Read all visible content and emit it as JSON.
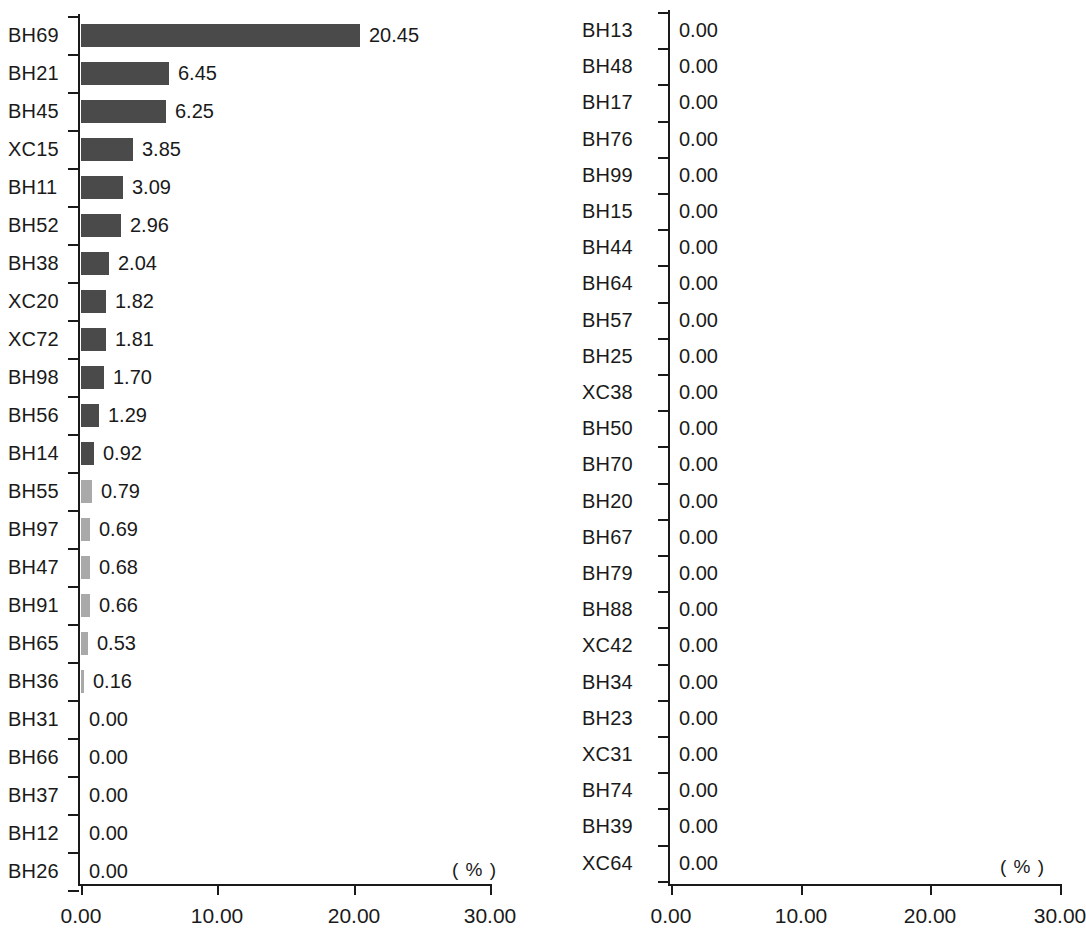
{
  "figure": {
    "background": "#ffffff",
    "bar_color": "#4a4a4a",
    "tiny_bar_color": "#a9a9a9",
    "axis_color": "#1a1a1a"
  },
  "chart_data": [
    {
      "type": "bar",
      "orientation": "horizontal",
      "id": "left-chart",
      "title": "",
      "xlabel": "( % )",
      "ylabel": "",
      "xlim": [
        0,
        30
      ],
      "grid": false,
      "legend": null,
      "xticks": [
        "0.00",
        "10.00",
        "20.00",
        "30.00"
      ],
      "xtick_values": [
        0,
        10,
        20,
        30
      ],
      "categories": [
        "BH69",
        "BH21",
        "BH45",
        "XC15",
        "BH11",
        "BH52",
        "BH38",
        "XC20",
        "XC72",
        "BH98",
        "BH56",
        "BH14",
        "BH55",
        "BH97",
        "BH47",
        "BH91",
        "BH65",
        "BH36",
        "BH31",
        "BH66",
        "BH37",
        "BH12",
        "BH26"
      ],
      "values": [
        20.45,
        6.45,
        6.25,
        3.85,
        3.09,
        2.96,
        2.04,
        1.82,
        1.81,
        1.7,
        1.29,
        0.92,
        0.79,
        0.69,
        0.68,
        0.66,
        0.53,
        0.16,
        0.0,
        0.0,
        0.0,
        0.0,
        0.0
      ],
      "value_labels": [
        "20.45",
        "6.45",
        "6.25",
        "3.85",
        "3.09",
        "2.96",
        "2.04",
        "1.82",
        "1.81",
        "1.70",
        "1.29",
        "0.92",
        "0.79",
        "0.69",
        "0.68",
        "0.66",
        "0.53",
        "0.16",
        "0.00",
        "0.00",
        "0.00",
        "0.00",
        "0.00"
      ]
    },
    {
      "type": "bar",
      "orientation": "horizontal",
      "id": "right-chart",
      "title": "",
      "xlabel": "( % )",
      "ylabel": "",
      "xlim": [
        0,
        30
      ],
      "grid": false,
      "legend": null,
      "xticks": [
        "0.00",
        "10.00",
        "20.00",
        "30.00"
      ],
      "xtick_values": [
        0,
        10,
        20,
        30
      ],
      "categories": [
        "BH13",
        "BH48",
        "BH17",
        "BH76",
        "BH99",
        "BH15",
        "BH44",
        "BH64",
        "BH57",
        "BH25",
        "XC38",
        "BH50",
        "BH70",
        "BH20",
        "BH67",
        "BH79",
        "BH88",
        "XC42",
        "BH34",
        "BH23",
        "XC31",
        "BH74",
        "BH39",
        "XC64"
      ],
      "values": [
        0.0,
        0.0,
        0.0,
        0.0,
        0.0,
        0.0,
        0.0,
        0.0,
        0.0,
        0.0,
        0.0,
        0.0,
        0.0,
        0.0,
        0.0,
        0.0,
        0.0,
        0.0,
        0.0,
        0.0,
        0.0,
        0.0,
        0.0,
        0.0
      ],
      "value_labels": [
        "0.00",
        "0.00",
        "0.00",
        "0.00",
        "0.00",
        "0.00",
        "0.00",
        "0.00",
        "0.00",
        "0.00",
        "0.00",
        "0.00",
        "0.00",
        "0.00",
        "0.00",
        "0.00",
        "0.00",
        "0.00",
        "0.00",
        "0.00",
        "0.00",
        "0.00",
        "0.00",
        "0.00"
      ]
    }
  ]
}
